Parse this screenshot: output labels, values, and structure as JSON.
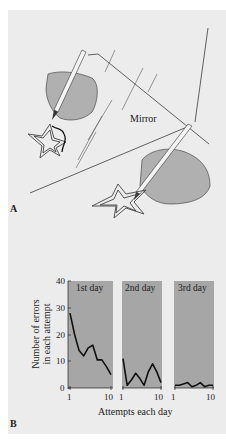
{
  "panel_a": {
    "letter": "A",
    "mirror_label": "Mirror",
    "description": "Mirror-drawing task: a hand traces a star while viewing it reflected in a mirror; the reflection shows the hand and star tracing"
  },
  "panel_b": {
    "letter": "B",
    "ylabel_line1": "Number of errors",
    "ylabel_line2": "in each attempt",
    "xlabel": "Attempts each day",
    "y_ticks": [
      "0",
      "10",
      "20",
      "30",
      "40"
    ],
    "x_tick_start": "1",
    "x_tick_end": "10",
    "days": [
      "1st day",
      "2nd day",
      "3rd day"
    ]
  },
  "colors": {
    "background": "#ececec",
    "chart_fill": "#a6a6a6",
    "line": "#111111",
    "hand_fill": "#b0b0b0"
  },
  "chart_data": {
    "type": "line",
    "title": "",
    "xlabel": "Attempts each day",
    "ylabel": "Number of errors in each attempt",
    "ylim": [
      0,
      40
    ],
    "x": [
      1,
      2,
      3,
      4,
      5,
      6,
      7,
      8,
      9,
      10
    ],
    "series": [
      {
        "name": "1st day",
        "values": [
          28,
          20,
          14,
          12,
          15,
          16,
          10.5,
          10.5,
          8,
          5
        ]
      },
      {
        "name": "2nd day",
        "values": [
          11,
          1,
          3,
          5.5,
          3.5,
          1,
          6,
          9,
          6,
          2
        ]
      },
      {
        "name": "3rd day",
        "values": [
          1,
          1,
          1.5,
          2,
          0.5,
          1,
          2,
          0.5,
          1,
          1
        ]
      }
    ],
    "grid": false,
    "legend_position": "panel titles"
  }
}
